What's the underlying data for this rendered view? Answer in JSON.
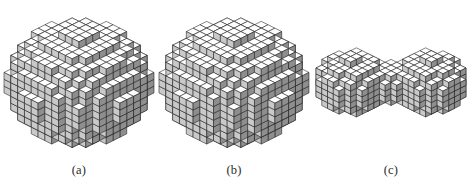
{
  "figure": {
    "type": "voxelized-3d-shapes",
    "background_color": "#ffffff",
    "render_style": "isometric-voxel-wireframe",
    "panel_count": 3
  },
  "panels": [
    {
      "id": "a",
      "caption": "(a)",
      "shape": "sphere",
      "description": "Voxelized sphere with highlighted interior voxels near centre",
      "radius_voxels": 7,
      "highlight_voxels": 5,
      "highlight_color": "#6d6d6d"
    },
    {
      "id": "b",
      "caption": "(b)",
      "shape": "sphere",
      "description": "Voxelized sphere with single dark cavity voxel near centre",
      "radius_voxels": 7,
      "highlight_voxels": 1,
      "highlight_color": "#1a1a1a"
    },
    {
      "id": "c",
      "caption": "(c)",
      "shape": "dumbbell",
      "description": "Voxelized dumbbell / peanut shaped object formed by two overlapping lobes",
      "radius_voxels": 5,
      "highlight_voxels": 0,
      "highlight_color": "#1a1a1a"
    }
  ],
  "colors": {
    "top_face": "#ffffff",
    "left_face": "#c9c9c9",
    "right_face": "#8e8e8e",
    "edge": "#1c1c1c",
    "caption_text": "#2b2b2b",
    "page_background": "#ffffff"
  },
  "chart_data": {
    "type": "scatter",
    "title": "",
    "xlabel": "",
    "ylabel": "",
    "series": [
      {
        "name": "(a) sphere",
        "shape": "sphere",
        "voxel_radius": 7.2,
        "voxel_count": 1550,
        "highlighted_cells": [
          {
            "x": 0,
            "y": 0,
            "z": 0
          },
          {
            "x": -1,
            "y": 0,
            "z": 0
          },
          {
            "x": 0,
            "y": -1,
            "z": 0
          },
          {
            "x": 0,
            "y": 0,
            "z": -1
          },
          {
            "x": -1,
            "y": -1,
            "z": 0
          }
        ]
      },
      {
        "name": "(b) sphere",
        "shape": "sphere",
        "voxel_radius": 7.2,
        "voxel_count": 1550,
        "highlighted_cells": [
          {
            "x": 0,
            "y": 0,
            "z": 0
          }
        ]
      },
      {
        "name": "(c) dumbbell",
        "shape": "dumbbell",
        "lobe_radius": 4.2,
        "lobe_offset": 3.4,
        "voxel_count": 620,
        "highlighted_cells": []
      }
    ]
  }
}
